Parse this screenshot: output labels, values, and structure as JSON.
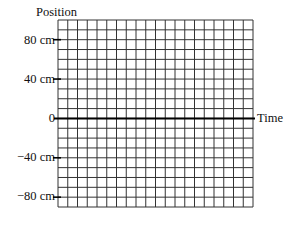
{
  "chart_data": {
    "type": "line",
    "title": "",
    "xlabel": "Time",
    "ylabel": "Position",
    "yticks": [
      {
        "value": 80,
        "label": "80 cm"
      },
      {
        "value": 40,
        "label": "40 cm"
      },
      {
        "value": 0,
        "label": "0"
      },
      {
        "value": -40,
        "label": "−40 cm"
      },
      {
        "value": -80,
        "label": "−80 cm"
      }
    ],
    "ylim": [
      -90,
      100
    ],
    "grid": true,
    "grid_rows": 19,
    "grid_cols": 20,
    "cell_value_cm": 10,
    "series": []
  }
}
